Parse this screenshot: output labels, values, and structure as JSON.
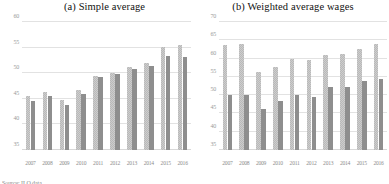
{
  "figure": {
    "source_note": "Source: ILO data"
  },
  "panels": [
    {
      "title": "(a)   Simple average",
      "ylim": [
        35,
        60
      ],
      "yticks": [
        35,
        40,
        45,
        50,
        55,
        60
      ],
      "ytick_labels": [
        "35",
        "40",
        "45",
        "50",
        "55",
        "60"
      ]
    },
    {
      "title": "(b) Weighted average wages",
      "ylim": [
        35,
        70
      ],
      "yticks": [
        35,
        40,
        45,
        50,
        55,
        60,
        65,
        70
      ],
      "ytick_labels": [
        "35",
        "40",
        "45",
        "50",
        "55",
        "60",
        "65",
        "70"
      ]
    }
  ],
  "chart_data": [
    {
      "type": "bar",
      "title": "(a)   Simple average",
      "xlabel": "",
      "ylabel": "",
      "ylim": [
        35,
        60
      ],
      "yticks": [
        35,
        40,
        45,
        50,
        55,
        60
      ],
      "grid": true,
      "legend": "none",
      "categories": [
        "2007",
        "2008",
        "2009",
        "2010",
        "2011",
        "2012",
        "2013",
        "2014",
        "2015",
        "2016"
      ],
      "series": [
        {
          "name": "light-hatched",
          "color": "#c6c6c6",
          "values": [
            45.6,
            46.3,
            44.8,
            46.7,
            49.5,
            50.1,
            51.3,
            52.0,
            55.1,
            55.5
          ]
        },
        {
          "name": "dark-solid",
          "color": "#8e8e8e",
          "values": [
            44.6,
            45.6,
            43.8,
            45.9,
            49.3,
            49.9,
            50.8,
            51.5,
            53.3,
            53.2
          ]
        }
      ]
    },
    {
      "type": "bar",
      "title": "(b) Weighted average wages",
      "xlabel": "",
      "ylabel": "",
      "ylim": [
        35,
        70
      ],
      "yticks": [
        35,
        40,
        45,
        50,
        55,
        60,
        65,
        70
      ],
      "grid": true,
      "legend": "none",
      "categories": [
        "2007",
        "2008",
        "2009",
        "2010",
        "2011",
        "2012",
        "2013",
        "2014",
        "2015",
        "2016"
      ],
      "series": [
        {
          "name": "light-hatched",
          "color": "#c6c6c6",
          "values": [
            63.8,
            64.0,
            56.4,
            57.8,
            59.9,
            59.6,
            61.0,
            61.3,
            62.7,
            64.0
          ]
        },
        {
          "name": "dark-solid",
          "color": "#8e8e8e",
          "values": [
            50.0,
            50.0,
            46.3,
            48.5,
            50.0,
            49.5,
            52.2,
            52.2,
            54.0,
            54.4
          ]
        }
      ]
    }
  ]
}
